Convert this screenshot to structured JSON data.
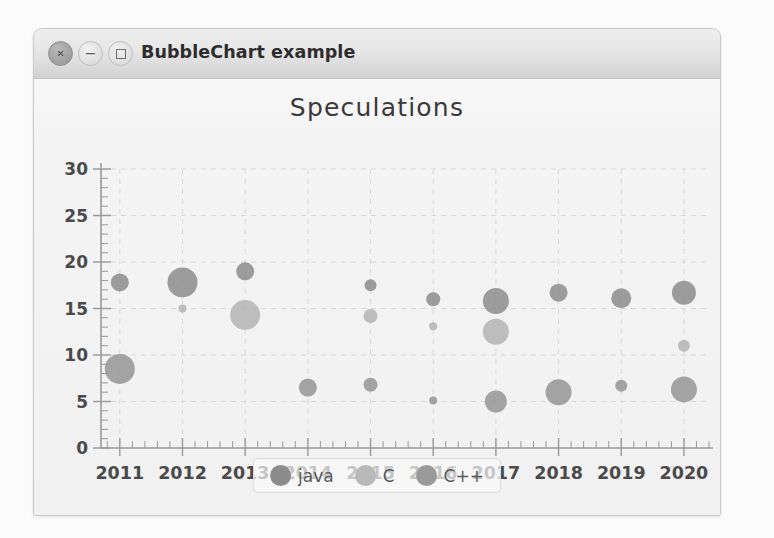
{
  "window": {
    "title": "BubbleChart example",
    "buttons": [
      {
        "name": "close",
        "glyph": "✕"
      },
      {
        "name": "minimize",
        "glyph": "−"
      },
      {
        "name": "maximize",
        "glyph": ""
      }
    ]
  },
  "chart_data": {
    "type": "scatter",
    "title": "Speculations",
    "xlabel": "",
    "ylabel": "",
    "grid": true,
    "legend_position": "bottom-center",
    "x": [
      2011,
      2012,
      2013,
      2014,
      2015,
      2016,
      2017,
      2018,
      2019,
      2020
    ],
    "xlim": [
      2010.7,
      2020.4
    ],
    "ylim": [
      0,
      30
    ],
    "yticks": [
      0,
      5,
      10,
      15,
      20,
      25,
      30
    ],
    "xticks": [
      "2011",
      "2012",
      "2013",
      "2014",
      "2015",
      "2016",
      "2017",
      "2018",
      "2019",
      "2020"
    ],
    "minor_ticks": true,
    "series": [
      {
        "name": "java",
        "color": "#8c8c8c",
        "points": [
          {
            "x": 2011,
            "y": 17.8,
            "size": 9
          },
          {
            "x": 2012,
            "y": 17.8,
            "size": 15
          },
          {
            "x": 2013,
            "y": 19.0,
            "size": 9
          },
          {
            "x": 2015,
            "y": 17.5,
            "size": 6
          },
          {
            "x": 2016,
            "y": 16.0,
            "size": 7
          },
          {
            "x": 2017,
            "y": 15.8,
            "size": 13
          },
          {
            "x": 2018,
            "y": 16.7,
            "size": 9
          },
          {
            "x": 2019,
            "y": 16.1,
            "size": 10
          },
          {
            "x": 2020,
            "y": 16.7,
            "size": 12
          }
        ]
      },
      {
        "name": "C",
        "color": "#b4b4b4",
        "points": [
          {
            "x": 2012,
            "y": 15.0,
            "size": 4
          },
          {
            "x": 2013,
            "y": 14.3,
            "size": 15
          },
          {
            "x": 2015,
            "y": 14.2,
            "size": 7
          },
          {
            "x": 2016,
            "y": 13.1,
            "size": 4
          },
          {
            "x": 2017,
            "y": 12.5,
            "size": 13
          },
          {
            "x": 2020,
            "y": 11.0,
            "size": 6
          }
        ]
      },
      {
        "name": "C++",
        "color": "#959595",
        "points": [
          {
            "x": 2011,
            "y": 8.5,
            "size": 15
          },
          {
            "x": 2014,
            "y": 6.5,
            "size": 9
          },
          {
            "x": 2015,
            "y": 6.8,
            "size": 7
          },
          {
            "x": 2016,
            "y": 5.1,
            "size": 4
          },
          {
            "x": 2017,
            "y": 5.0,
            "size": 11
          },
          {
            "x": 2018,
            "y": 6.0,
            "size": 13
          },
          {
            "x": 2019,
            "y": 6.7,
            "size": 6
          },
          {
            "x": 2020,
            "y": 6.3,
            "size": 13
          }
        ]
      }
    ],
    "legend": [
      {
        "label": "java",
        "color": "#8c8c8c"
      },
      {
        "label": "C",
        "color": "#b9b9b9"
      },
      {
        "label": "C++",
        "color": "#9a9a9a"
      }
    ]
  },
  "colors": {
    "grid": "#d8d8d8",
    "axis": "#9a9a9a",
    "tick_text": "#4a4a4a",
    "title_text": "#3a3a3a"
  }
}
